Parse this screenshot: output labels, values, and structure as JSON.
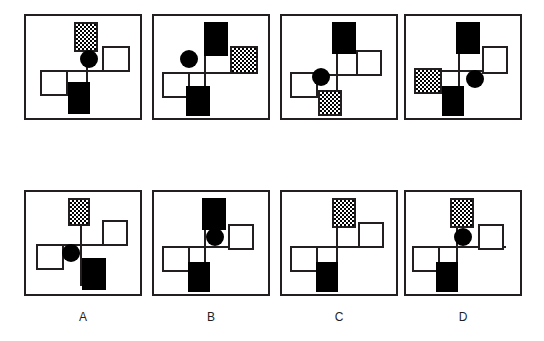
{
  "figure": {
    "title": "",
    "kind": "visual-analogy-puzzle",
    "panel_width": 118,
    "panel_height": 106,
    "colors": {
      "stroke": "#231f20",
      "fill_black": "#000000",
      "fill_white": "#ffffff",
      "background": "#ffffff"
    }
  },
  "rows": [
    {
      "name": "problem-row",
      "panels": [
        {
          "id": "problem-1",
          "cross": {
            "v_x": 60,
            "v_top": 18,
            "v_bottom": 92,
            "h_y": 54,
            "h_left": 14,
            "h_right": 104
          },
          "elements": [
            {
              "name": "tile-top",
              "shape": "square",
              "fill": "checker",
              "x": 48,
              "y": 6,
              "w": 24,
              "h": 30
            },
            {
              "name": "tile-right",
              "shape": "square",
              "fill": "white",
              "x": 76,
              "y": 30,
              "w": 28,
              "h": 26
            },
            {
              "name": "tile-left",
              "shape": "square",
              "fill": "white",
              "x": 14,
              "y": 54,
              "w": 28,
              "h": 26
            },
            {
              "name": "tile-bottom",
              "shape": "square",
              "fill": "black",
              "x": 42,
              "y": 66,
              "w": 22,
              "h": 32
            },
            {
              "name": "dot",
              "shape": "circle",
              "fill": "black",
              "x": 54,
              "y": 34,
              "w": 18,
              "h": 18
            }
          ]
        },
        {
          "id": "problem-2",
          "cross": {
            "v_x": 50,
            "v_top": 8,
            "v_bottom": 94,
            "h_y": 56,
            "h_left": 8,
            "h_right": 104
          },
          "elements": [
            {
              "name": "tile-top",
              "shape": "square",
              "fill": "black",
              "x": 50,
              "y": 6,
              "w": 24,
              "h": 34
            },
            {
              "name": "tile-right",
              "shape": "square",
              "fill": "checker",
              "x": 76,
              "y": 30,
              "w": 28,
              "h": 28
            },
            {
              "name": "tile-left",
              "shape": "square",
              "fill": "white",
              "x": 8,
              "y": 56,
              "w": 28,
              "h": 26
            },
            {
              "name": "tile-bottom",
              "shape": "square",
              "fill": "black",
              "x": 32,
              "y": 70,
              "w": 24,
              "h": 30
            },
            {
              "name": "dot",
              "shape": "circle",
              "fill": "black",
              "x": 26,
              "y": 34,
              "w": 18,
              "h": 18
            }
          ]
        },
        {
          "id": "problem-3",
          "cross": {
            "v_x": 54,
            "v_top": 10,
            "v_bottom": 94,
            "h_y": 58,
            "h_left": 8,
            "h_right": 100
          },
          "elements": [
            {
              "name": "tile-top",
              "shape": "square",
              "fill": "black",
              "x": 50,
              "y": 6,
              "w": 24,
              "h": 32
            },
            {
              "name": "tile-right",
              "shape": "square",
              "fill": "white",
              "x": 74,
              "y": 34,
              "w": 26,
              "h": 26
            },
            {
              "name": "tile-left",
              "shape": "square",
              "fill": "white",
              "x": 8,
              "y": 56,
              "w": 28,
              "h": 26
            },
            {
              "name": "tile-bottom",
              "shape": "square",
              "fill": "checker",
              "x": 36,
              "y": 74,
              "w": 24,
              "h": 26
            },
            {
              "name": "dot",
              "shape": "circle",
              "fill": "black",
              "x": 30,
              "y": 52,
              "w": 18,
              "h": 18
            }
          ]
        },
        {
          "id": "problem-4",
          "cross": {
            "v_x": 52,
            "v_top": 10,
            "v_bottom": 94,
            "h_y": 54,
            "h_left": 8,
            "h_right": 102
          },
          "elements": [
            {
              "name": "tile-top",
              "shape": "square",
              "fill": "black",
              "x": 50,
              "y": 6,
              "w": 24,
              "h": 32
            },
            {
              "name": "tile-right",
              "shape": "square",
              "fill": "white",
              "x": 76,
              "y": 30,
              "w": 26,
              "h": 28
            },
            {
              "name": "tile-left",
              "shape": "square",
              "fill": "checker",
              "x": 8,
              "y": 52,
              "w": 28,
              "h": 26
            },
            {
              "name": "tile-bottom",
              "shape": "square",
              "fill": "black",
              "x": 36,
              "y": 70,
              "w": 22,
              "h": 30
            },
            {
              "name": "dot",
              "shape": "circle",
              "fill": "black",
              "x": 60,
              "y": 54,
              "w": 18,
              "h": 18
            }
          ]
        }
      ]
    },
    {
      "name": "answer-row",
      "panels": [
        {
          "id": "answer-A",
          "label": "A",
          "cross": {
            "v_x": 54,
            "v_top": 8,
            "v_bottom": 94,
            "h_y": 52,
            "h_left": 10,
            "h_right": 102
          },
          "elements": [
            {
              "name": "tile-top",
              "shape": "square",
              "fill": "checker",
              "x": 42,
              "y": 6,
              "w": 22,
              "h": 28
            },
            {
              "name": "tile-right",
              "shape": "square",
              "fill": "white",
              "x": 76,
              "y": 28,
              "w": 26,
              "h": 26
            },
            {
              "name": "tile-left",
              "shape": "square",
              "fill": "white",
              "x": 10,
              "y": 52,
              "w": 28,
              "h": 26
            },
            {
              "name": "tile-bottom",
              "shape": "square",
              "fill": "black",
              "x": 56,
              "y": 66,
              "w": 24,
              "h": 32
            },
            {
              "name": "dot",
              "shape": "circle",
              "fill": "black",
              "x": 36,
              "y": 52,
              "w": 18,
              "h": 18
            }
          ]
        },
        {
          "id": "answer-B",
          "label": "B",
          "cross": {
            "v_x": 50,
            "v_top": 8,
            "v_bottom": 94,
            "h_y": 54,
            "h_left": 8,
            "h_right": 100
          },
          "elements": [
            {
              "name": "tile-top",
              "shape": "square",
              "fill": "black",
              "x": 48,
              "y": 6,
              "w": 24,
              "h": 32
            },
            {
              "name": "tile-right",
              "shape": "square",
              "fill": "white",
              "x": 74,
              "y": 32,
              "w": 26,
              "h": 26
            },
            {
              "name": "tile-left",
              "shape": "square",
              "fill": "white",
              "x": 8,
              "y": 54,
              "w": 28,
              "h": 26
            },
            {
              "name": "tile-bottom",
              "shape": "square",
              "fill": "black",
              "x": 34,
              "y": 70,
              "w": 22,
              "h": 30
            },
            {
              "name": "dot",
              "shape": "circle",
              "fill": "black",
              "x": 52,
              "y": 36,
              "w": 18,
              "h": 18
            }
          ]
        },
        {
          "id": "answer-C",
          "label": "C",
          "cross": {
            "v_x": 54,
            "v_top": 8,
            "v_bottom": 94,
            "h_y": 54,
            "h_left": 8,
            "h_right": 102
          },
          "elements": [
            {
              "name": "tile-top",
              "shape": "square",
              "fill": "checker",
              "x": 50,
              "y": 6,
              "w": 24,
              "h": 30
            },
            {
              "name": "tile-right",
              "shape": "square",
              "fill": "white",
              "x": 76,
              "y": 30,
              "w": 26,
              "h": 26
            },
            {
              "name": "tile-left",
              "shape": "square",
              "fill": "white",
              "x": 8,
              "y": 54,
              "w": 28,
              "h": 26
            },
            {
              "name": "tile-bottom",
              "shape": "square",
              "fill": "black",
              "x": 34,
              "y": 70,
              "w": 22,
              "h": 30
            }
          ]
        },
        {
          "id": "answer-D",
          "label": "D",
          "cross": {
            "v_x": 50,
            "v_top": 8,
            "v_bottom": 94,
            "h_y": 54,
            "h_left": 6,
            "h_right": 100
          },
          "elements": [
            {
              "name": "tile-top",
              "shape": "square",
              "fill": "checker",
              "x": 44,
              "y": 6,
              "w": 24,
              "h": 30
            },
            {
              "name": "tile-right",
              "shape": "square",
              "fill": "white",
              "x": 72,
              "y": 32,
              "w": 26,
              "h": 26
            },
            {
              "name": "tile-left",
              "shape": "square",
              "fill": "white",
              "x": 6,
              "y": 54,
              "w": 28,
              "h": 26
            },
            {
              "name": "tile-bottom",
              "shape": "square",
              "fill": "black",
              "x": 30,
              "y": 70,
              "w": 22,
              "h": 30
            },
            {
              "name": "dot",
              "shape": "circle",
              "fill": "black",
              "x": 48,
              "y": 36,
              "w": 18,
              "h": 18
            }
          ]
        }
      ]
    }
  ],
  "labels": [
    "A",
    "B",
    "C",
    "D"
  ]
}
